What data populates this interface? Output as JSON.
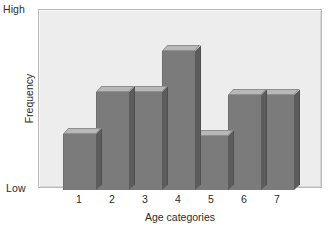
{
  "chart_data": {
    "type": "bar",
    "title": "",
    "subtitle": "",
    "xlabel": "Age categories",
    "ylabel": "Frequency",
    "categories": [
      "1",
      "2",
      "3",
      "4",
      "5",
      "6",
      "7"
    ],
    "values": [
      33,
      58,
      58,
      82,
      32,
      56,
      56
    ],
    "ylim": [
      0,
      100
    ],
    "ytick_labels": [
      "High",
      "Low"
    ],
    "ytick_values": [
      100,
      0
    ],
    "grid": false,
    "legend": null,
    "legend_position": "none",
    "annotations": [],
    "style": {
      "bar_face_color": "#7b7b7b",
      "bar_top_color": "#b8b8b8",
      "bar_side_color": "#5c5c5c",
      "plot_background": "#ededed",
      "frame_color": "#b9b9b9",
      "text_color": "#2b2b2b",
      "three_d": true,
      "bar_gap": 0
    }
  },
  "axes": {
    "y": {
      "title": "Frequency",
      "high_label": "High",
      "low_label": "Low"
    },
    "x": {
      "title": "Age categories",
      "ticks": [
        "1",
        "2",
        "3",
        "4",
        "5",
        "6",
        "7"
      ]
    }
  }
}
